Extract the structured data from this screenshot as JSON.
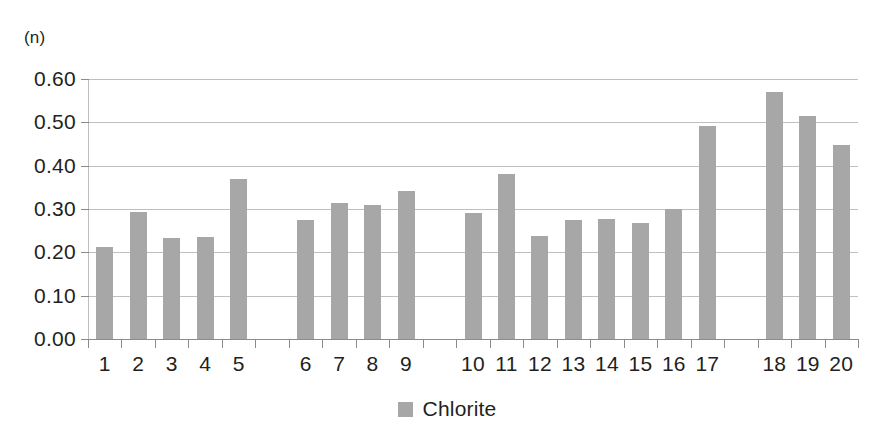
{
  "chart_data": {
    "type": "bar",
    "title": "",
    "subtitle": "",
    "xlabel": "",
    "ylabel": "(n)",
    "unit_label": "(n)",
    "ylim": [
      0.0,
      0.6
    ],
    "ytick_labels": [
      "0.60",
      "0.50",
      "0.40",
      "0.30",
      "0.20",
      "0.10",
      "0.00"
    ],
    "ytick_values": [
      0.6,
      0.5,
      0.4,
      0.3,
      0.2,
      0.1,
      0.0
    ],
    "grid": "horizontal",
    "legend_position": "bottom-center",
    "legend": [
      {
        "name": "Chlorite",
        "color": "#a7a7a7"
      }
    ],
    "series": [
      {
        "name": "Chlorite",
        "color": "#a7a7a7",
        "values": [
          0.213,
          0.293,
          0.234,
          0.235,
          0.37,
          0.275,
          0.315,
          0.31,
          0.342,
          0.29,
          0.381,
          0.238,
          0.275,
          0.276,
          0.268,
          0.301,
          0.491,
          0.569,
          0.515,
          0.447
        ]
      }
    ],
    "categories": [
      "1",
      "2",
      "3",
      "4",
      "5",
      "6",
      "7",
      "8",
      "9",
      "10",
      "11",
      "12",
      "13",
      "14",
      "15",
      "16",
      "17",
      "18",
      "19",
      "20"
    ],
    "group_gaps_after": [
      5,
      9,
      17
    ],
    "bar_color": "#a7a7a7",
    "gridline_color": "#bfbfbf",
    "axis_color": "#8c8c8c",
    "text_color": "#231f20",
    "background": "#ffffff"
  }
}
